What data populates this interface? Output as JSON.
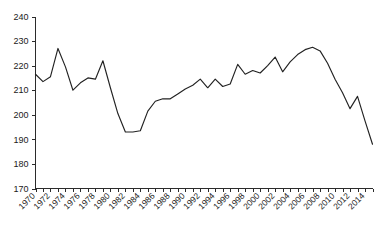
{
  "chart_data": {
    "type": "line",
    "title": "",
    "subtitle": "",
    "xlabel": "",
    "ylabel": "",
    "xlim": [
      1970,
      2014
    ],
    "ylim": [
      170,
      240
    ],
    "ytick_step": 10,
    "xtick_step": 1,
    "xtick_label_step": 2,
    "grid": false,
    "legend": false,
    "legend_position": "none",
    "line_color": "#222222",
    "axis_color": "#2b2b2b",
    "background_color": "#ffffff",
    "ytick_labels": [
      "240",
      "230",
      "220",
      "210",
      "200",
      "190",
      "180",
      "170"
    ],
    "ytick_values": [
      240,
      230,
      220,
      210,
      200,
      190,
      180,
      170
    ],
    "xtick_labels": [
      "1970",
      "1972",
      "1974",
      "1976",
      "1978",
      "1980",
      "1982",
      "1984",
      "1986",
      "1988",
      "1990",
      "1992",
      "1994",
      "1996",
      "1998",
      "2000",
      "2002",
      "2004",
      "2006",
      "2008",
      "2010",
      "2012",
      "2014"
    ],
    "xtick_values": [
      1970,
      1972,
      1974,
      1976,
      1978,
      1980,
      1982,
      1984,
      1986,
      1988,
      1990,
      1992,
      1994,
      1996,
      1998,
      2000,
      2002,
      2004,
      2006,
      2008,
      2010,
      2012,
      2014
    ],
    "x": [
      1970,
      1971,
      1972,
      1973,
      1974,
      1975,
      1976,
      1977,
      1978,
      1979,
      1980,
      1981,
      1982,
      1983,
      1984,
      1985,
      1986,
      1987,
      1988,
      1989,
      1990,
      1991,
      1992,
      1993,
      1994,
      1995,
      1996,
      1997,
      1998,
      1999,
      2000,
      2001,
      2002,
      2003,
      2004,
      2005,
      2006,
      2007,
      2008,
      2009,
      2010,
      2011,
      2012,
      2013,
      2014
    ],
    "values": [
      216.5,
      213.5,
      215.5,
      227.0,
      219.5,
      210.0,
      213.0,
      215.0,
      214.5,
      222.0,
      211.0,
      200.5,
      193.0,
      193.0,
      193.5,
      201.5,
      205.5,
      206.5,
      206.5,
      208.5,
      210.5,
      212.0,
      214.5,
      211.0,
      214.5,
      211.5,
      212.5,
      220.5,
      216.5,
      218.0,
      217.0,
      220.0,
      223.5,
      217.5,
      221.5,
      224.5,
      226.5,
      227.5,
      226.0,
      221.0,
      214.5,
      209.0,
      202.5,
      207.5,
      197.5
    ],
    "series": [
      {
        "name": "series-1",
        "values": [
          216.5,
          213.5,
          215.5,
          227.0,
          219.5,
          210.0,
          213.0,
          215.0,
          214.5,
          222.0,
          211.0,
          200.5,
          193.0,
          193.0,
          193.5,
          201.5,
          205.5,
          206.5,
          206.5,
          208.5,
          210.5,
          212.0,
          214.5,
          211.0,
          214.5,
          211.5,
          212.5,
          220.5,
          216.5,
          218.0,
          217.0,
          220.0,
          223.5,
          217.5,
          221.5,
          224.5,
          226.5,
          227.5,
          226.0,
          221.0,
          214.5,
          209.0,
          202.5,
          207.5,
          197.5
        ]
      }
    ],
    "extra_points": {
      "final_x": 2015,
      "final_value": 188.0
    },
    "annotations": []
  }
}
